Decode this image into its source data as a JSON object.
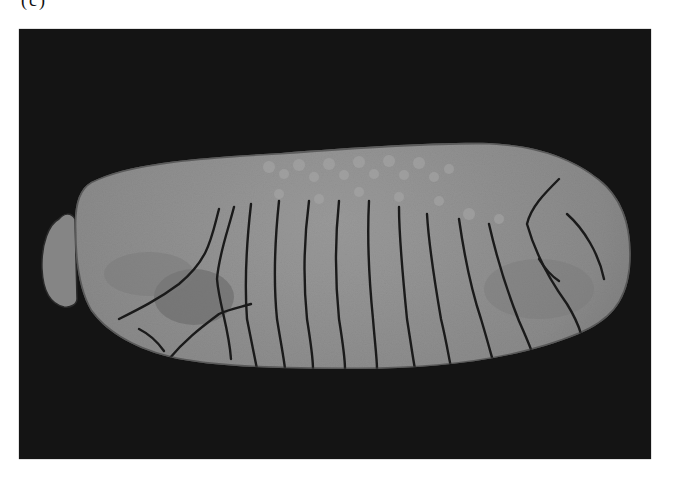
{
  "figure": {
    "panel_label": "(c)",
    "alt_description": "Grayscale photograph of a segmented, elongated specimen (insect larva / pupa-like body) with transverse ridges, on a black background",
    "colors": {
      "page_background": "#ffffff",
      "photo_background": "#141414",
      "specimen_fill": "#8a8a8a",
      "specimen_highlight": "#a3a3a3",
      "specimen_shadow": "#6f6f6f",
      "crease_lines": "#1a1a1a"
    }
  }
}
